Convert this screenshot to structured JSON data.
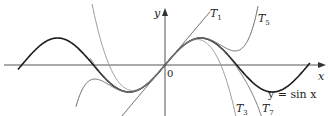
{
  "figure": {
    "axes": {
      "x_label": "x",
      "y_label": "y",
      "origin_label": "0"
    },
    "curves": [
      {
        "name": "sin",
        "label": "y = sin x",
        "color": "#1a1a1a",
        "width": 1.6
      },
      {
        "name": "T1",
        "label_main": "T",
        "label_sub": "1",
        "color": "#555555"
      },
      {
        "name": "T3",
        "label_main": "T",
        "label_sub": "3",
        "color": "#9a9a9a"
      },
      {
        "name": "T5",
        "label_main": "T",
        "label_sub": "5",
        "color": "#6a6a6a"
      },
      {
        "name": "T7",
        "label_main": "T",
        "label_sub": "7",
        "color": "#777777"
      }
    ],
    "colors": {
      "axis": "#555555",
      "background": "#ffffff"
    }
  }
}
